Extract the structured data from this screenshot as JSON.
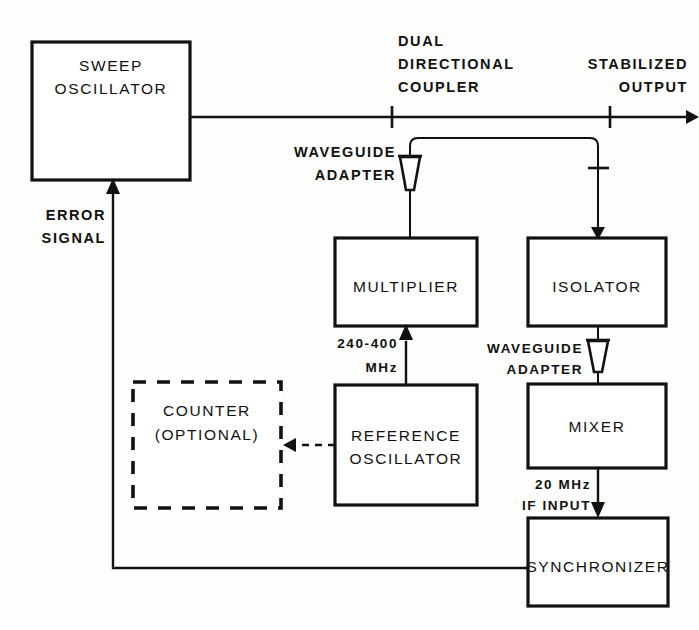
{
  "diagram": {
    "line_color": "#111111",
    "background": "#fdfdfb",
    "blocks": [
      {
        "id": "sweep-oscillator",
        "label_line1": "SWEEP",
        "label_line2": "OSCILLATOR",
        "style": "solid"
      },
      {
        "id": "multiplier",
        "label_line1": "MULTIPLIER",
        "label_line2": "",
        "style": "solid"
      },
      {
        "id": "isolator",
        "label_line1": "ISOLATOR",
        "label_line2": "",
        "style": "solid"
      },
      {
        "id": "mixer",
        "label_line1": "MIXER",
        "label_line2": "",
        "style": "solid"
      },
      {
        "id": "reference-oscillator",
        "label_line1": "REFERENCE",
        "label_line2": "OSCILLATOR",
        "style": "solid"
      },
      {
        "id": "counter",
        "label_line1": "COUNTER",
        "label_line2": "(OPTIONAL)",
        "style": "dashed"
      },
      {
        "id": "synchronizer",
        "label_line1": "SYNCHRONIZER",
        "label_line2": "",
        "style": "solid"
      }
    ],
    "annotations": {
      "dual_directional_coupler_l1": "DUAL",
      "dual_directional_coupler_l2": "DIRECTIONAL",
      "dual_directional_coupler_l3": "COUPLER",
      "stabilized_output_l1": "STABILIZED",
      "stabilized_output_l2": "OUTPUT",
      "waveguide_adapter_top_l1": "WAVEGUIDE",
      "waveguide_adapter_top_l2": "ADAPTER",
      "waveguide_adapter_mid_l1": "WAVEGUIDE",
      "waveguide_adapter_mid_l2": "ADAPTER",
      "error_signal_l1": "ERROR",
      "error_signal_l2": "SIGNAL",
      "multiplier_input_l1": "240-400",
      "multiplier_input_l2": "MHz",
      "if_input_l1": "20 MHz",
      "if_input_l2": "IF INPUT"
    }
  }
}
